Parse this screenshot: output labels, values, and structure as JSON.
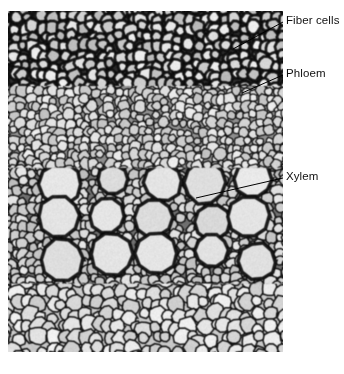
{
  "figure": {
    "type": "light-micrograph",
    "background_color": "#ffffff",
    "image_region": {
      "x": 8,
      "y": 11,
      "width": 275,
      "height": 341
    },
    "palette": {
      "cell_wall_dark": "#1c1c1c",
      "cell_lumen_light": "#e8e8e8",
      "mid_tone": "#8a8a8a",
      "label_text": "#111111",
      "leader_line": "#000000"
    }
  },
  "callouts": [
    {
      "id": "fiber-cells",
      "label": "Fiber cells",
      "text_x": 286,
      "text_y": 14,
      "leader": {
        "x1": 283,
        "y1": 22,
        "x2": 233,
        "y2": 49
      }
    },
    {
      "id": "phloem",
      "label": "Phloem",
      "text_x": 286,
      "text_y": 67,
      "leader": {
        "x1": 283,
        "y1": 75,
        "x2": 242,
        "y2": 93
      }
    },
    {
      "id": "xylem",
      "label": "Xylem",
      "text_x": 286,
      "text_y": 170,
      "leader": {
        "x1": 283,
        "y1": 178,
        "x2": 196,
        "y2": 198
      }
    }
  ],
  "tissue_zones": [
    {
      "name": "fiber cells",
      "band_top": 0,
      "band_bottom": 0.22,
      "description": "dark thick-walled sclerenchyma fibers, small round lumens"
    },
    {
      "name": "phloem",
      "band_top": 0.22,
      "band_bottom": 0.46,
      "description": "small pale thin-walled sieve tube and companion cells"
    },
    {
      "name": "xylem",
      "band_top": 0.46,
      "band_bottom": 0.8,
      "description": "large round vessel elements with thick dark walls"
    },
    {
      "name": "parenchyma",
      "band_top": 0.8,
      "band_bottom": 1.0,
      "description": "pale polygonal ground tissue cells"
    }
  ]
}
